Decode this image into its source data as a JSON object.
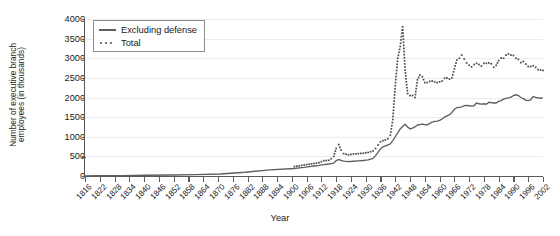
{
  "chart_data": {
    "type": "line",
    "title": "",
    "xlabel": "Year",
    "ylabel": "Number of executive branch employees (in thousands)",
    "ylabel_line1": "Number of executive branch",
    "ylabel_line2": "employees (in thousands)",
    "xlim": [
      1816,
      2002
    ],
    "ylim": [
      0,
      4000
    ],
    "y_ticks": [
      0,
      500,
      1000,
      1500,
      2000,
      2500,
      3000,
      3500,
      4000
    ],
    "y_tick_labels": [
      "0",
      "500",
      "1000",
      "1500",
      "2000",
      "2500",
      "3000",
      "3500",
      "4000"
    ],
    "x_ticks": [
      1816,
      1822,
      1828,
      1834,
      1840,
      1846,
      1852,
      1858,
      1864,
      1870,
      1876,
      1882,
      1888,
      1894,
      1900,
      1906,
      1912,
      1918,
      1924,
      1930,
      1936,
      1942,
      1948,
      1954,
      1960,
      1966,
      1972,
      1978,
      1984,
      1990,
      1996,
      2002
    ],
    "x_tick_labels": [
      "1816",
      "1822",
      "1828",
      "1834",
      "1840",
      "1846",
      "1852",
      "1858",
      "1864",
      "1870",
      "1876",
      "1882",
      "1888",
      "1894",
      "1900",
      "1906",
      "1912",
      "1918",
      "1924",
      "1930",
      "1936",
      "1942",
      "1948",
      "1954",
      "1960",
      "1966",
      "1972",
      "1978",
      "1984",
      "1990",
      "1996",
      "2002"
    ],
    "grid": true,
    "grid_axis": "y",
    "legend_position": "upper-left",
    "series": [
      {
        "name": "Excluding defense",
        "style": "solid",
        "color": "#5e5e5e",
        "x": [
          1816,
          1821,
          1831,
          1841,
          1851,
          1861,
          1871,
          1881,
          1891,
          1901,
          1903,
          1905,
          1907,
          1909,
          1911,
          1913,
          1915,
          1917,
          1918,
          1919,
          1920,
          1921,
          1923,
          1925,
          1927,
          1929,
          1931,
          1933,
          1934,
          1935,
          1936,
          1937,
          1938,
          1939,
          1940,
          1941,
          1942,
          1943,
          1944,
          1945,
          1946,
          1947,
          1948,
          1949,
          1950,
          1951,
          1952,
          1953,
          1954,
          1955,
          1956,
          1957,
          1958,
          1959,
          1960,
          1961,
          1962,
          1963,
          1964,
          1965,
          1966,
          1967,
          1968,
          1969,
          1970,
          1971,
          1972,
          1973,
          1974,
          1975,
          1976,
          1977,
          1978,
          1979,
          1980,
          1981,
          1982,
          1983,
          1984,
          1985,
          1986,
          1987,
          1988,
          1989,
          1990,
          1991,
          1992,
          1993,
          1994,
          1995,
          1996,
          1997,
          1998,
          1999,
          2000,
          2001,
          2002
        ],
        "y": [
          4,
          7,
          11,
          18,
          26,
          37,
          51,
          95,
          158,
          190,
          205,
          220,
          240,
          255,
          270,
          290,
          305,
          330,
          390,
          420,
          400,
          380,
          365,
          375,
          385,
          395,
          410,
          450,
          520,
          600,
          690,
          740,
          770,
          790,
          820,
          900,
          1000,
          1100,
          1200,
          1260,
          1320,
          1250,
          1200,
          1220,
          1250,
          1300,
          1310,
          1320,
          1310,
          1300,
          1340,
          1370,
          1390,
          1400,
          1420,
          1450,
          1500,
          1530,
          1560,
          1620,
          1700,
          1740,
          1750,
          1760,
          1790,
          1800,
          1790,
          1780,
          1790,
          1860,
          1840,
          1830,
          1840,
          1830,
          1880,
          1870,
          1860,
          1860,
          1900,
          1920,
          1960,
          1980,
          1990,
          2010,
          2050,
          2070,
          2050,
          2000,
          1970,
          1930,
          1920,
          1940,
          2030,
          2000,
          1990,
          1980,
          1990
        ]
      },
      {
        "name": "Total",
        "style": "dotted",
        "color": "#4a4a4a",
        "x": [
          1901,
          1903,
          1905,
          1907,
          1909,
          1911,
          1913,
          1915,
          1916,
          1917,
          1918,
          1919,
          1920,
          1921,
          1923,
          1925,
          1927,
          1929,
          1931,
          1933,
          1934,
          1935,
          1936,
          1937,
          1938,
          1939,
          1940,
          1941,
          1942,
          1943,
          1944,
          1945,
          1946,
          1947,
          1948,
          1949,
          1950,
          1951,
          1952,
          1953,
          1954,
          1955,
          1956,
          1957,
          1958,
          1959,
          1960,
          1961,
          1962,
          1963,
          1964,
          1965,
          1966,
          1967,
          1968,
          1969,
          1970,
          1971,
          1972,
          1973,
          1974,
          1975,
          1976,
          1977,
          1978,
          1979,
          1980,
          1981,
          1982,
          1983,
          1984,
          1985,
          1986,
          1987,
          1988,
          1989,
          1990,
          1991,
          1992,
          1993,
          1994,
          1995,
          1996,
          1997,
          1998,
          1999,
          2000,
          2001,
          2002
        ],
        "y": [
          240,
          260,
          280,
          300,
          320,
          340,
          390,
          400,
          440,
          500,
          700,
          800,
          660,
          570,
          540,
          560,
          570,
          580,
          600,
          640,
          700,
          790,
          870,
          900,
          920,
          950,
          1040,
          1440,
          2300,
          3000,
          3300,
          3800,
          2700,
          2100,
          2050,
          2050,
          2000,
          2450,
          2570,
          2530,
          2380,
          2380,
          2410,
          2420,
          2400,
          2380,
          2400,
          2420,
          2490,
          2500,
          2470,
          2500,
          2730,
          2950,
          3000,
          3080,
          2980,
          2880,
          2820,
          2780,
          2840,
          2870,
          2840,
          2800,
          2870,
          2870,
          2880,
          2860,
          2770,
          2820,
          2940,
          3010,
          3000,
          3080,
          3110,
          3080,
          3070,
          3000,
          2970,
          2890,
          2920,
          2850,
          2790,
          2790,
          2810,
          2770,
          2710,
          2700,
          2690
        ]
      }
    ]
  },
  "legend": {
    "items": [
      {
        "label": "Excluding defense",
        "style": "solid"
      },
      {
        "label": "Total",
        "style": "dotted"
      }
    ]
  }
}
